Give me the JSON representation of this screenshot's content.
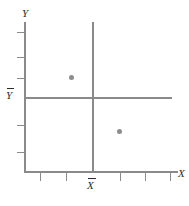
{
  "figure": {
    "background_color": "#ffffff",
    "line_color": "#8a8a8a",
    "point_color": "#8c8c8c",
    "text_color": "#2b2b2b"
  },
  "labels": {
    "y_axis": "Y",
    "x_axis": "X",
    "y_mean": "Y",
    "x_mean": "X"
  },
  "chart_data": {
    "type": "scatter",
    "title": "",
    "xlabel": "X",
    "ylabel": "Y",
    "xlim": [
      0,
      6
    ],
    "ylim": [
      0,
      6
    ],
    "grid": false,
    "legend": null,
    "points": [
      {
        "x": 1.8,
        "y": 3.6
      },
      {
        "x": 3.6,
        "y": 1.6
      }
    ],
    "reference_lines": [
      {
        "name": "x-mean",
        "orientation": "vertical",
        "label": "X̄",
        "value": 2.6
      },
      {
        "name": "y-mean",
        "orientation": "horizontal",
        "label": "Ȳ",
        "value": 2.8
      }
    ],
    "x_ticks": [
      0.6,
      1.5,
      2.6,
      3.5,
      4.4,
      5.3
    ],
    "y_ticks": [
      0.8,
      1.6,
      2.8,
      3.7,
      4.5,
      5.4
    ],
    "tick_labels": {
      "x": [],
      "y": []
    }
  },
  "geometry": {
    "y_tick_positions": [
      32,
      57,
      78,
      125,
      152
    ],
    "x_tick_positions": [
      40,
      66,
      120,
      145,
      170
    ],
    "point_positions": [
      {
        "left": 69,
        "top": 75
      },
      {
        "left": 117,
        "top": 129
      }
    ]
  }
}
